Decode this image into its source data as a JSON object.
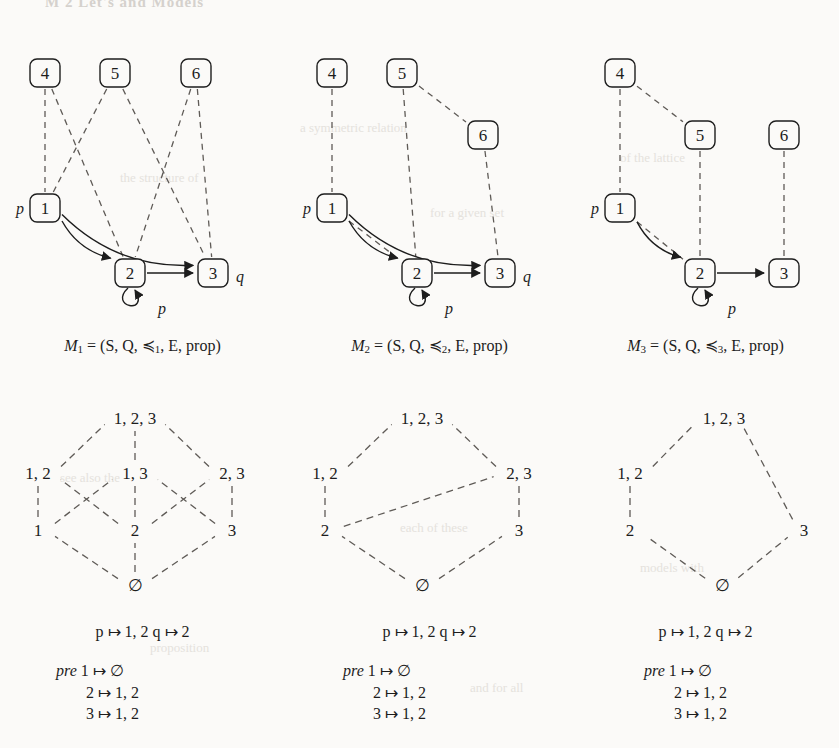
{
  "page": {
    "header_sliver": "M 2 Let's and Models",
    "background": "#fbfaf8",
    "ink": "#1d1d1d",
    "dash_color": "#5f5b57"
  },
  "ghost_text": [
    {
      "text": "a symmetric relation",
      "x": 300,
      "y": 120
    },
    {
      "text": "the structure of",
      "x": 120,
      "y": 170
    },
    {
      "text": "for a given set",
      "x": 430,
      "y": 205
    },
    {
      "text": "of the lattice",
      "x": 620,
      "y": 150
    },
    {
      "text": "see also the",
      "x": 60,
      "y": 470
    },
    {
      "text": "each of these",
      "x": 400,
      "y": 520
    },
    {
      "text": "models with",
      "x": 640,
      "y": 560
    },
    {
      "text": "proposition",
      "x": 150,
      "y": 640
    },
    {
      "text": "and for all",
      "x": 470,
      "y": 680
    }
  ],
  "columns": [
    {
      "id": "model-1",
      "caption": {
        "name": "M",
        "index": "1",
        "equals": "=",
        "tuple": "(S, Q, ≼",
        "tuple_index": "1",
        "tuple_tail": ", E, prop)",
        "full": "M1 = (S, Q, ≼1, E, prop)"
      },
      "graph": {
        "nodes": [
          {
            "id": "4",
            "label": "4",
            "x": 45,
            "y": 55
          },
          {
            "id": "5",
            "label": "5",
            "x": 115,
            "y": 55
          },
          {
            "id": "6",
            "label": "6",
            "x": 196,
            "y": 55
          },
          {
            "id": "1",
            "label": "1",
            "x": 45,
            "y": 190
          },
          {
            "id": "2",
            "label": "2",
            "x": 130,
            "y": 255
          },
          {
            "id": "3",
            "label": "3",
            "x": 213,
            "y": 255
          }
        ],
        "state_labels": [
          {
            "text": "p",
            "for": "1",
            "x": 20,
            "y": 190
          },
          {
            "text": "q",
            "for": "3",
            "x": 240,
            "y": 258
          },
          {
            "text": "p",
            "for": "2-selfloop",
            "x": 162,
            "y": 290
          }
        ],
        "dashed_edges": [
          {
            "from": "4",
            "to": "1"
          },
          {
            "from": "4",
            "to": "2"
          },
          {
            "from": "5",
            "to": "1"
          },
          {
            "from": "5",
            "to": "3"
          },
          {
            "from": "6",
            "to": "2"
          },
          {
            "from": "6",
            "to": "3"
          }
        ],
        "solid_edges": [
          {
            "from": "1",
            "to": "2",
            "kind": "curve"
          },
          {
            "from": "1",
            "to": "3",
            "kind": "curve"
          },
          {
            "from": "2",
            "to": "3",
            "kind": "straight"
          },
          {
            "from": "2",
            "to": "2",
            "kind": "selfloop"
          }
        ]
      },
      "lattice": {
        "nodes": [
          {
            "id": "top",
            "label": "1, 2, 3",
            "x": 135,
            "y": 23
          },
          {
            "id": "12",
            "label": "1, 2",
            "x": 38,
            "y": 78
          },
          {
            "id": "13",
            "label": "1, 3",
            "x": 135,
            "y": 78
          },
          {
            "id": "23",
            "label": "2, 3",
            "x": 232,
            "y": 78
          },
          {
            "id": "1",
            "label": "1",
            "x": 38,
            "y": 135
          },
          {
            "id": "2",
            "label": "2",
            "x": 135,
            "y": 135
          },
          {
            "id": "3",
            "label": "3",
            "x": 232,
            "y": 135
          },
          {
            "id": "bot",
            "label": "∅",
            "x": 135,
            "y": 190
          }
        ],
        "edges": [
          {
            "from": "12",
            "to": "top"
          },
          {
            "from": "13",
            "to": "top"
          },
          {
            "from": "23",
            "to": "top"
          },
          {
            "from": "1",
            "to": "12"
          },
          {
            "from": "1",
            "to": "13"
          },
          {
            "from": "2",
            "to": "12"
          },
          {
            "from": "2",
            "to": "13"
          },
          {
            "from": "2",
            "to": "23"
          },
          {
            "from": "3",
            "to": "13"
          },
          {
            "from": "3",
            "to": "23"
          },
          {
            "from": "bot",
            "to": "1"
          },
          {
            "from": "bot",
            "to": "2"
          },
          {
            "from": "bot",
            "to": "3"
          }
        ]
      },
      "maps": {
        "prop_line": "p ↦ 1, 2  q ↦ 2",
        "pre_label": "pre",
        "pre_lines": [
          "1 ↦ ∅",
          "2 ↦ 1, 2",
          "3 ↦ 1, 2"
        ]
      }
    },
    {
      "id": "model-2",
      "caption": {
        "name": "M",
        "index": "2",
        "equals": "=",
        "tuple": "(S, Q, ≼",
        "tuple_index": "2",
        "tuple_tail": ", E, prop)",
        "full": "M2 = (S, Q, ≼2, E, prop)"
      },
      "graph": {
        "nodes": [
          {
            "id": "4",
            "label": "4",
            "x": 45,
            "y": 55
          },
          {
            "id": "5",
            "label": "5",
            "x": 115,
            "y": 55
          },
          {
            "id": "6",
            "label": "6",
            "x": 196,
            "y": 117
          },
          {
            "id": "1",
            "label": "1",
            "x": 45,
            "y": 190
          },
          {
            "id": "2",
            "label": "2",
            "x": 130,
            "y": 255
          },
          {
            "id": "3",
            "label": "3",
            "x": 213,
            "y": 255
          }
        ],
        "state_labels": [
          {
            "text": "p",
            "for": "1",
            "x": 20,
            "y": 190
          },
          {
            "text": "q",
            "for": "3",
            "x": 240,
            "y": 258
          },
          {
            "text": "p",
            "for": "2-selfloop",
            "x": 162,
            "y": 290
          }
        ],
        "dashed_edges": [
          {
            "from": "4",
            "to": "1"
          },
          {
            "from": "5",
            "to": "2"
          },
          {
            "from": "5",
            "to": "6"
          },
          {
            "from": "6",
            "to": "3"
          },
          {
            "from": "1",
            "to": "2"
          }
        ],
        "solid_edges": [
          {
            "from": "1",
            "to": "2",
            "kind": "curve"
          },
          {
            "from": "1",
            "to": "3",
            "kind": "curve"
          },
          {
            "from": "2",
            "to": "3",
            "kind": "straight"
          },
          {
            "from": "2",
            "to": "2",
            "kind": "selfloop"
          }
        ]
      },
      "lattice": {
        "nodes": [
          {
            "id": "top",
            "label": "1, 2, 3",
            "x": 135,
            "y": 23
          },
          {
            "id": "12",
            "label": "1, 2",
            "x": 38,
            "y": 78
          },
          {
            "id": "23",
            "label": "2, 3",
            "x": 232,
            "y": 78
          },
          {
            "id": "2",
            "label": "2",
            "x": 38,
            "y": 135
          },
          {
            "id": "3",
            "label": "3",
            "x": 232,
            "y": 135
          },
          {
            "id": "bot",
            "label": "∅",
            "x": 135,
            "y": 190
          }
        ],
        "edges": [
          {
            "from": "12",
            "to": "top"
          },
          {
            "from": "23",
            "to": "top"
          },
          {
            "from": "2",
            "to": "12"
          },
          {
            "from": "2",
            "to": "23"
          },
          {
            "from": "3",
            "to": "23"
          },
          {
            "from": "bot",
            "to": "2"
          },
          {
            "from": "bot",
            "to": "3"
          }
        ]
      },
      "maps": {
        "prop_line": "p ↦ 1, 2  q ↦ 2",
        "pre_label": "pre",
        "pre_lines": [
          "1 ↦ ∅",
          "2 ↦ 1, 2",
          "3 ↦ 1, 2"
        ]
      }
    },
    {
      "id": "model-3",
      "caption": {
        "name": "M",
        "index": "3",
        "equals": "=",
        "tuple": "(S, Q, ≼",
        "tuple_index": "3",
        "tuple_tail": ", E, prop)",
        "full": "M3 = (S, Q, ≼3, E, prop)"
      },
      "graph": {
        "nodes": [
          {
            "id": "4",
            "label": "4",
            "x": 48,
            "y": 55
          },
          {
            "id": "5",
            "label": "5",
            "x": 128,
            "y": 117
          },
          {
            "id": "6",
            "label": "6",
            "x": 212,
            "y": 117
          },
          {
            "id": "1",
            "label": "1",
            "x": 48,
            "y": 190
          },
          {
            "id": "2",
            "label": "2",
            "x": 128,
            "y": 255
          },
          {
            "id": "3",
            "label": "3",
            "x": 212,
            "y": 255
          }
        ],
        "state_labels": [
          {
            "text": "p",
            "for": "1",
            "x": 23,
            "y": 190
          },
          {
            "text": "p",
            "for": "2-selfloop",
            "x": 160,
            "y": 290
          }
        ],
        "dashed_edges": [
          {
            "from": "4",
            "to": "1"
          },
          {
            "from": "4",
            "to": "5"
          },
          {
            "from": "5",
            "to": "2"
          },
          {
            "from": "6",
            "to": "3"
          },
          {
            "from": "1",
            "to": "2"
          }
        ],
        "solid_edges": [
          {
            "from": "1",
            "to": "2",
            "kind": "curve"
          },
          {
            "from": "2",
            "to": "3",
            "kind": "straight"
          },
          {
            "from": "2",
            "to": "2",
            "kind": "selfloop"
          }
        ]
      },
      "lattice": {
        "nodes": [
          {
            "id": "top",
            "label": "1, 2, 3",
            "x": 152,
            "y": 23
          },
          {
            "id": "12",
            "label": "1, 2",
            "x": 58,
            "y": 78
          },
          {
            "id": "2",
            "label": "2",
            "x": 58,
            "y": 135
          },
          {
            "id": "3",
            "label": "3",
            "x": 232,
            "y": 135
          },
          {
            "id": "bot",
            "label": "∅",
            "x": 150,
            "y": 190
          }
        ],
        "edges": [
          {
            "from": "12",
            "to": "top"
          },
          {
            "from": "3",
            "to": "top"
          },
          {
            "from": "2",
            "to": "12"
          },
          {
            "from": "bot",
            "to": "2"
          },
          {
            "from": "bot",
            "to": "3"
          }
        ]
      },
      "maps": {
        "prop_line": "p ↦ 1, 2  q ↦ 2",
        "pre_label": "pre",
        "pre_lines": [
          "1 ↦ ∅",
          "2 ↦ 1, 2",
          "3 ↦ 1, 2"
        ]
      }
    }
  ]
}
